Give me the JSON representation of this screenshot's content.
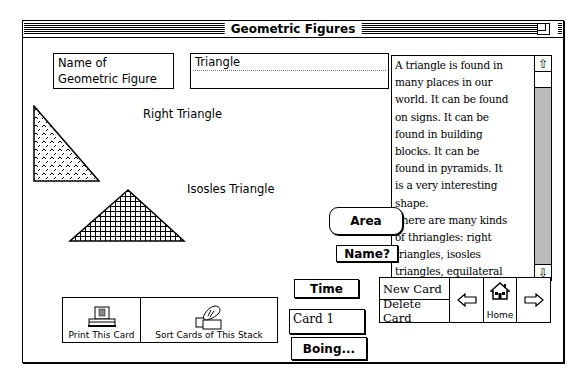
{
  "window": {
    "title": "Geometric Figures"
  },
  "header": {
    "name_label": [
      "Name of",
      "Geometric Figure"
    ],
    "name_value": "Triangle"
  },
  "figures": [
    {
      "label": "Right Triangle",
      "icon": "right-triangle-shape"
    },
    {
      "label": "Isosles Triangle",
      "icon": "isosceles-triangle-shape"
    }
  ],
  "description": {
    "lines": [
      "A triangle is found in",
      "many places in our",
      "world.  It can be found",
      "on signs.  It can be",
      "found in building",
      "blocks.  It can be",
      "found in pyramids.  It",
      "is a very interesting",
      "shape.",
      "There are many kinds",
      "of thriangles:  right",
      "triangles, isosles",
      "triangles, equilateral",
      "triangles, obtuse",
      "triangles, acute"
    ]
  },
  "buttons": {
    "area": "Area",
    "name": "Name?",
    "time": "Time",
    "boing": "Boing..."
  },
  "card_field": "Card 1",
  "toolbar": {
    "print": "Print This Card",
    "sort": "Sort Cards of This Stack"
  },
  "nav": {
    "new_card": "New Card",
    "delete_card": "Delete Card",
    "home": "Home",
    "prev_icon": "left-arrow-icon",
    "next_icon": "right-arrow-icon"
  }
}
